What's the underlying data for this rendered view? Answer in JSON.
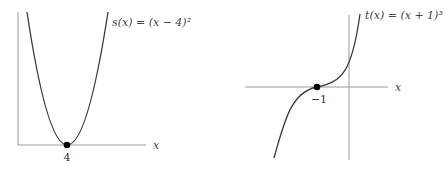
{
  "figures": [
    {
      "id": "left",
      "function_label": "s(x) = (x − 4)²",
      "x_axis_label": "x",
      "marked_point_label": "4",
      "marked_point": {
        "x": 4,
        "y": 0
      },
      "shape": "parabola (vertex on x-axis)"
    },
    {
      "id": "right",
      "function_label": "t(x) = (x + 1)³",
      "x_axis_label": "x",
      "marked_point_label": "−1",
      "marked_point": {
        "x": -1,
        "y": 0
      },
      "shape": "cubic (inflection on x-axis)"
    }
  ],
  "colors": {
    "axis": "#9a9a9a",
    "curve": "#3a3a3a",
    "point": "#000000",
    "text": "#444444"
  }
}
